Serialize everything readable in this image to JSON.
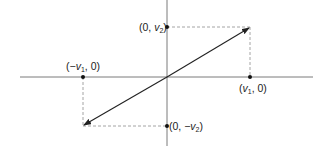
{
  "diagram": {
    "type": "vector-coordinate-diagram",
    "colors": {
      "axis": "#7a7a7a",
      "vector": "#222222",
      "dashed": "#9a9a9a",
      "point": "#111111"
    },
    "axes": {
      "origin": [
        167,
        77
      ],
      "x_axis": {
        "from": [
          20,
          77
        ],
        "to": [
          313,
          77
        ]
      },
      "y_axis": {
        "from": [
          167,
          0
        ],
        "to": [
          167,
          146
        ]
      }
    },
    "points": [
      {
        "id": "v2",
        "label_prefix": "(0, ",
        "var": "v",
        "sub": "2",
        "label_suffix": ")",
        "pos": [
          167,
          27
        ]
      },
      {
        "id": "v1",
        "label_prefix": "(",
        "var": "v",
        "sub": "1",
        "label_suffix": ", 0)",
        "pos": [
          250,
          77
        ]
      },
      {
        "id": "neg-v1",
        "label_prefix": "(−",
        "var": "v",
        "sub": "1",
        "label_suffix": ", 0)",
        "pos": [
          83,
          77
        ]
      },
      {
        "id": "neg-v2",
        "label_prefix": "(0, −",
        "var": "v",
        "sub": "2",
        "label_suffix": ")",
        "pos": [
          167,
          126
        ]
      }
    ],
    "vectors": [
      {
        "name": "v",
        "from": [
          167,
          77
        ],
        "to": [
          250,
          27
        ]
      },
      {
        "name": "minus-v",
        "from": [
          167,
          77
        ],
        "to": [
          83,
          126
        ]
      }
    ],
    "dashed_lines": [
      {
        "from": [
          167,
          27
        ],
        "to": [
          250,
          27
        ]
      },
      {
        "from": [
          250,
          27
        ],
        "to": [
          250,
          77
        ]
      },
      {
        "from": [
          83,
          77
        ],
        "to": [
          83,
          126
        ]
      },
      {
        "from": [
          83,
          126
        ],
        "to": [
          167,
          126
        ]
      }
    ]
  }
}
